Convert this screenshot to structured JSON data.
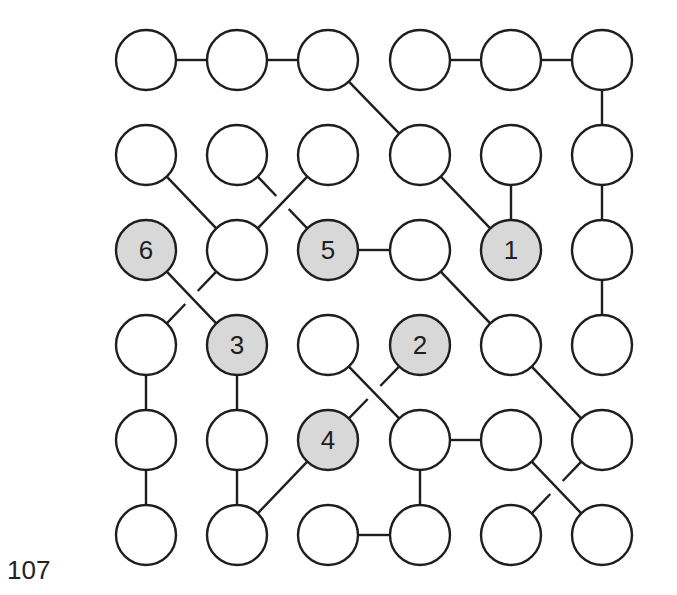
{
  "puzzle": {
    "number": "107",
    "grid": {
      "rows": 6,
      "cols": 6
    },
    "layout": {
      "col_x": [
        146,
        237,
        328,
        420,
        511,
        602
      ],
      "row_y": [
        60,
        155,
        250,
        345,
        440,
        535
      ],
      "radius": 30
    },
    "colors": {
      "stroke": "#1e1e1e",
      "empty_fill": "#ffffff",
      "numbered_fill": "#d8d8d8",
      "text": "#1e1e1e"
    },
    "numbered_nodes": [
      {
        "row": 2,
        "col": 4,
        "label": "1"
      },
      {
        "row": 3,
        "col": 3,
        "label": "2"
      },
      {
        "row": 3,
        "col": 1,
        "label": "3"
      },
      {
        "row": 4,
        "col": 2,
        "label": "4"
      },
      {
        "row": 2,
        "col": 2,
        "label": "5"
      },
      {
        "row": 2,
        "col": 0,
        "label": "6"
      }
    ],
    "edges": [
      {
        "from": [
          0,
          0
        ],
        "to": [
          0,
          1
        ]
      },
      {
        "from": [
          0,
          1
        ],
        "to": [
          0,
          2
        ]
      },
      {
        "from": [
          0,
          3
        ],
        "to": [
          0,
          4
        ]
      },
      {
        "from": [
          0,
          4
        ],
        "to": [
          0,
          5
        ]
      },
      {
        "from": [
          0,
          2
        ],
        "to": [
          1,
          3
        ]
      },
      {
        "from": [
          1,
          3
        ],
        "to": [
          2,
          4
        ]
      },
      {
        "from": [
          1,
          4
        ],
        "to": [
          2,
          4
        ]
      },
      {
        "from": [
          0,
          5
        ],
        "to": [
          1,
          5
        ]
      },
      {
        "from": [
          1,
          5
        ],
        "to": [
          2,
          5
        ]
      },
      {
        "from": [
          2,
          5
        ],
        "to": [
          3,
          5
        ]
      },
      {
        "from": [
          1,
          0
        ],
        "to": [
          2,
          1
        ]
      },
      {
        "from": [
          1,
          1
        ],
        "to": [
          2,
          2
        ],
        "under": true
      },
      {
        "from": [
          1,
          2
        ],
        "to": [
          2,
          1
        ]
      },
      {
        "from": [
          2,
          2
        ],
        "to": [
          2,
          3
        ]
      },
      {
        "from": [
          2,
          3
        ],
        "to": [
          3,
          4
        ]
      },
      {
        "from": [
          3,
          4
        ],
        "to": [
          4,
          5
        ]
      },
      {
        "from": [
          2,
          0
        ],
        "to": [
          3,
          1
        ]
      },
      {
        "from": [
          2,
          1
        ],
        "to": [
          3,
          0
        ],
        "under": true
      },
      {
        "from": [
          3,
          0
        ],
        "to": [
          4,
          0
        ]
      },
      {
        "from": [
          4,
          0
        ],
        "to": [
          5,
          0
        ]
      },
      {
        "from": [
          3,
          1
        ],
        "to": [
          4,
          1
        ]
      },
      {
        "from": [
          4,
          1
        ],
        "to": [
          5,
          1
        ]
      },
      {
        "from": [
          5,
          1
        ],
        "to": [
          4,
          2
        ]
      },
      {
        "from": [
          3,
          2
        ],
        "to": [
          4,
          3
        ]
      },
      {
        "from": [
          3,
          3
        ],
        "to": [
          4,
          2
        ],
        "under": true
      },
      {
        "from": [
          4,
          3
        ],
        "to": [
          4,
          4
        ]
      },
      {
        "from": [
          4,
          3
        ],
        "to": [
          5,
          3
        ]
      },
      {
        "from": [
          5,
          2
        ],
        "to": [
          5,
          3
        ]
      },
      {
        "from": [
          4,
          4
        ],
        "to": [
          5,
          5
        ]
      },
      {
        "from": [
          4,
          5
        ],
        "to": [
          5,
          4
        ],
        "under": true
      }
    ]
  }
}
